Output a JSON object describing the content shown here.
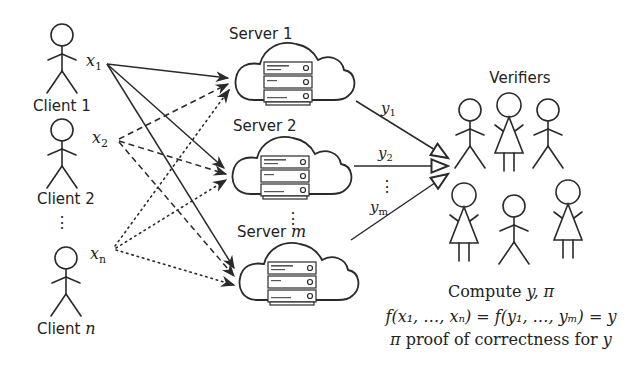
{
  "diagram": {
    "clients": [
      {
        "label": "Client 1",
        "input": "x",
        "input_sub": "1"
      },
      {
        "label": "Client 2",
        "input": "x",
        "input_sub": "2"
      },
      {
        "label": "Client ",
        "label_math": "n",
        "input": "x",
        "input_sub": "n"
      }
    ],
    "client_ellipsis": "⋮",
    "servers": [
      {
        "label": "Server 1",
        "output": "y",
        "output_sub": "1"
      },
      {
        "label": "Server 2",
        "output": "y",
        "output_sub": "2"
      },
      {
        "label": "Server ",
        "label_math": "m",
        "output": "y",
        "output_sub": "m"
      }
    ],
    "server_ellipsis": "⋮",
    "output_ellipsis": "⋮",
    "verifiers": {
      "label": "Verifiers",
      "count": 6
    },
    "caption": {
      "line1_text": "Compute ",
      "line1_math": "y, π",
      "line2": "f(x₁, …, xₙ) = f(y₁, …, yₘ) = y",
      "line3_math_pre": "π",
      "line3_text": " proof of correctness for ",
      "line3_math_post": "y"
    },
    "edge_styles": {
      "client1": "solid",
      "client2": "dashed",
      "clientn": "dotted"
    }
  }
}
